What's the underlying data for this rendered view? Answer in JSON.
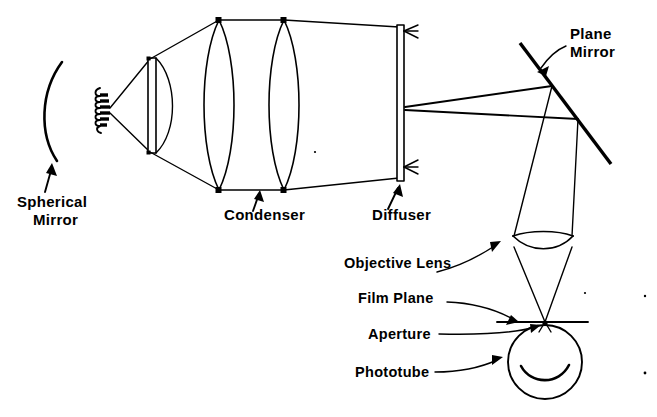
{
  "figure": {
    "background_color": "#ffffff",
    "ink_color": "#000000",
    "width": 657,
    "height": 417
  },
  "labels": {
    "spherical_mirror_line1": "Spherical",
    "spherical_mirror_line2": "Mirror",
    "condenser": "Condenser",
    "diffuser": "Diffuser",
    "plane_mirror_line1": "Plane",
    "plane_mirror_line2": "Mirror",
    "objective_lens": "Objective Lens",
    "film_plane": "Film Plane",
    "aperture": "Aperture",
    "phototube": "Phototube"
  },
  "components": [
    {
      "name": "spherical-mirror",
      "label": "Spherical Mirror",
      "type": "concave-mirror-arc",
      "position": {
        "x": 55,
        "y": 110
      },
      "leader_arrow": true
    },
    {
      "name": "lamp-filament",
      "label": "",
      "type": "coil-filament",
      "position": {
        "x": 104,
        "y": 110
      },
      "leader_arrow": false
    },
    {
      "name": "plano-convex-lens",
      "label": "",
      "type": "plano-convex-lens",
      "position": {
        "x": 160,
        "y": 105
      },
      "leader_arrow": false
    },
    {
      "name": "condenser-lens-1",
      "label": "Condenser",
      "type": "biconvex-lens",
      "position": {
        "x": 224,
        "y": 105
      },
      "leader_arrow": true
    },
    {
      "name": "condenser-lens-2",
      "label": "Condenser",
      "type": "biconvex-lens",
      "position": {
        "x": 285,
        "y": 105
      },
      "leader_arrow": true
    },
    {
      "name": "diffuser",
      "label": "Diffuser",
      "type": "vertical-plate",
      "position": {
        "x": 401,
        "y": 102
      },
      "leader_arrow": true
    },
    {
      "name": "plane-mirror",
      "label": "Plane Mirror",
      "type": "flat-mirror",
      "position": {
        "x": 564,
        "y": 103
      },
      "leader_arrow": true
    },
    {
      "name": "objective-lens",
      "label": "Objective Lens",
      "type": "biconvex-lens",
      "position": {
        "x": 543,
        "y": 240
      },
      "leader_arrow": true
    },
    {
      "name": "film-plane",
      "label": "Film Plane",
      "type": "horizontal-line",
      "position": {
        "x": 543,
        "y": 322
      },
      "leader_arrow": true
    },
    {
      "name": "aperture",
      "label": "Aperture",
      "type": "point-stop",
      "position": {
        "x": 545,
        "y": 324
      },
      "leader_arrow": true
    },
    {
      "name": "phototube",
      "label": "Phototube",
      "type": "circle-detector",
      "position": {
        "x": 545,
        "y": 360
      },
      "leader_arrow": true
    }
  ],
  "label_positions": {
    "spherical_mirror": {
      "x": 17,
      "y": 207
    },
    "condenser": {
      "x": 224,
      "y": 220
    },
    "diffuser": {
      "x": 372,
      "y": 220
    },
    "plane_mirror": {
      "x": 570,
      "y": 39
    },
    "objective_lens": {
      "x": 344,
      "y": 268
    },
    "film_plane": {
      "x": 358,
      "y": 303
    },
    "aperture": {
      "x": 368,
      "y": 334
    },
    "phototube": {
      "x": 355,
      "y": 369
    }
  }
}
